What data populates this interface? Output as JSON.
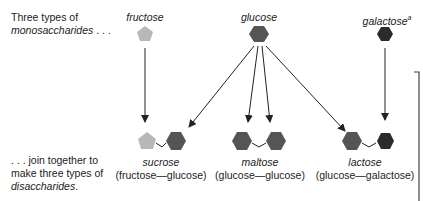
{
  "intro": {
    "line1": "Three types of",
    "line2_italic": "monosaccharides",
    "line2_suffix": " . . ."
  },
  "outro": {
    "line1": ". . . join together to",
    "line2": "make three types of",
    "line3_italic": "disaccharides",
    "line3_suffix": "."
  },
  "monosaccharides": [
    {
      "name": "fructose",
      "shape": "pentagon",
      "color": "#b8b8b8"
    },
    {
      "name": "glucose",
      "shape": "hexagon",
      "color": "#555555"
    },
    {
      "name": "galactose",
      "superscript": "a",
      "shape": "hexagon",
      "color": "#2b2b2b"
    }
  ],
  "disaccharides": [
    {
      "name": "sucrose",
      "composition": "(fructose—glucose)"
    },
    {
      "name": "maltose",
      "composition": "(glucose—glucose)"
    },
    {
      "name": "lactose",
      "composition": "(glucose—galactose)"
    }
  ],
  "colors": {
    "fructose": "#b8b8b8",
    "glucose": "#555555",
    "galactose": "#2b2b2b",
    "arrow": "#222222"
  }
}
